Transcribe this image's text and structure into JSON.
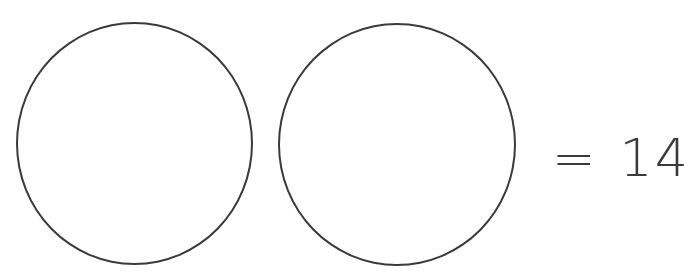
{
  "diagram": {
    "shapes": [
      {
        "type": "circle",
        "label": ""
      },
      {
        "type": "circle",
        "label": ""
      }
    ],
    "equals_sign": "=",
    "total": "14",
    "stroke_color": "#3a3a3a",
    "background": "#ffffff"
  }
}
